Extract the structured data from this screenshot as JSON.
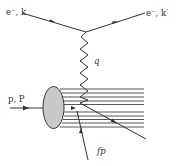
{
  "diagram": {
    "type": "deep-inelastic-scattering",
    "colors": {
      "line": "#333333",
      "proton_blob": "#c8c8c8",
      "background": "#ffffff"
    },
    "labels": {
      "incoming_electron": "e⁻, k",
      "outgoing_electron": "e⁻, k′",
      "photon": "q",
      "proton": "p, P",
      "parton": "fp"
    },
    "elements": {
      "incoming_electron_line": {
        "from": [
          22,
          13
        ],
        "to": [
          86,
          32
        ]
      },
      "outgoing_electron_line": {
        "from": [
          86,
          32
        ],
        "to": [
          145,
          13
        ]
      },
      "photon_wiggle": {
        "from": [
          86,
          32
        ],
        "to": [
          80,
          103
        ]
      },
      "proton_line": {
        "from": [
          10,
          108
        ],
        "to": [
          43,
          108
        ]
      },
      "proton_blob": {
        "cx": 53.5,
        "cy": 107.5,
        "rx": 10.5,
        "ry": 21
      },
      "spectator_lines_y": [
        89,
        93,
        97,
        101,
        104.5,
        112,
        116,
        119.5,
        123,
        127
      ],
      "struck_quark_line": {
        "from": [
          80,
          103
        ],
        "to": [
          146,
          139
        ]
      },
      "parton_arrow": {
        "from": [
          88,
          160
        ],
        "to": [
          76,
          109
        ]
      }
    }
  }
}
